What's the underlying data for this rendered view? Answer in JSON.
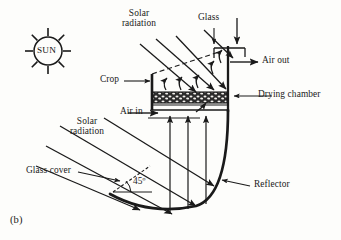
{
  "figure": {
    "caption": "(b)",
    "type": "schematic-diagram",
    "background_color": "#fdfdfb",
    "ink_color": "#1a1a1a"
  },
  "sun": {
    "label": "SUN",
    "ray_count": 8,
    "center": {
      "x": 48,
      "y": 51
    },
    "circle_radius": 14,
    "ray_inner": 15,
    "ray_outer": 23
  },
  "labels": {
    "solar_radiation_top": {
      "line1": "Solar",
      "line2": "radiation"
    },
    "solar_radiation_left": {
      "line1": "Solar",
      "line2": "radiation"
    },
    "glass": "Glass",
    "air_out": "Air out",
    "drying_chamber": "Drying chamber",
    "crop": "Crop",
    "air_in": "Air in",
    "glass_cover": "Glass cover",
    "reflector": "Reflector",
    "angle": "45º"
  },
  "geometry": {
    "chamber": {
      "left_wall_x": 152,
      "right_wall_x": 228,
      "top_y": 74,
      "bed_top_y": 93,
      "bed_bottom_y": 103,
      "floor_y": 110
    },
    "chimney": {
      "x": 228,
      "top_y": 46,
      "cap_left": 212,
      "cap_right": 245
    },
    "reflector": {
      "apex_x": 110,
      "apex_y": 194,
      "rim_right_x": 228,
      "rim_y": 110,
      "stroke_width": 2.6
    },
    "angle_marker": {
      "vertex_x": 113,
      "vertex_y": 192,
      "degrees": 45
    }
  },
  "flows": {
    "incoming_ray_count": 6,
    "reflected_vertical_ray_count": 3,
    "internal_convection_arrows": 5
  }
}
